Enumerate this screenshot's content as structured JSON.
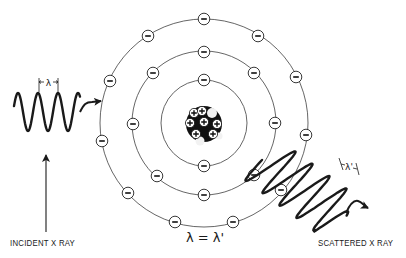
{
  "diagram": {
    "type": "compton-scattering-atom",
    "labels": {
      "incident": "INCIDENT X RAY",
      "scattered": "SCATTERED X RAY",
      "equation": "λ = λ'",
      "incident_wavelength": "λ",
      "scattered_wavelength": "λ'"
    },
    "atom": {
      "center": [
        204,
        123
      ],
      "orbit_radii": [
        43,
        72,
        104
      ],
      "electron_symbol": "−",
      "electrons": {
        "inner": [
          [
            204,
            80
          ],
          [
            204,
            166
          ]
        ],
        "middle": [
          [
            204,
            52
          ],
          [
            153,
            73
          ],
          [
            254,
            73
          ],
          [
            133,
            124
          ],
          [
            275,
            123
          ],
          [
            157,
            176
          ],
          [
            254,
            175
          ],
          [
            204,
            195
          ]
        ],
        "outer": [
          [
            204,
            19
          ],
          [
            148,
            36
          ],
          [
            258,
            36
          ],
          [
            110,
            81
          ],
          [
            296,
            77
          ],
          [
            102,
            141
          ],
          [
            306,
            135
          ],
          [
            128,
            193
          ],
          [
            281,
            190
          ],
          [
            175,
            222
          ],
          [
            233,
            222
          ]
        ]
      },
      "nucleus": {
        "radius": 18,
        "proton_symbol": "+",
        "protons": [
          [
            194,
            113
          ],
          [
            202,
            111
          ],
          [
            190,
            123
          ],
          [
            204,
            122
          ],
          [
            217,
            124
          ],
          [
            196,
            134
          ],
          [
            213,
            134
          ]
        ]
      }
    },
    "colors": {
      "ink": "#1a1a1a",
      "orbit": "#555555",
      "background": "#ffffff"
    }
  }
}
